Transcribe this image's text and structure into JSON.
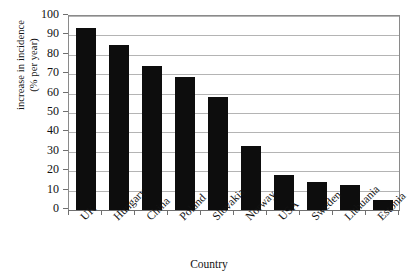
{
  "chart_data": {
    "type": "bar",
    "title": "",
    "subtitle": "",
    "xlabel": "Country",
    "ylabel": "increase in incidence (% per year)",
    "ylabel_line1": "increase in incidence",
    "ylabel_line2": "(% per year)",
    "categories": [
      "UK",
      "Hungary",
      "China",
      "Poland",
      "Slovakia",
      "Norway",
      "USA",
      "Sweden",
      "Lithuania",
      "Estonia"
    ],
    "values": [
      94,
      85,
      74,
      68.5,
      58,
      33,
      18,
      14.5,
      13,
      5
    ],
    "ylim": [
      0,
      100
    ],
    "ytick_labels": [
      "100",
      "90",
      "80",
      "70",
      "60",
      "50",
      "40",
      "30",
      "20",
      "10",
      "0"
    ],
    "ytick_values": [
      100,
      90,
      80,
      70,
      60,
      50,
      40,
      30,
      20,
      10,
      0
    ],
    "ytick_step": 10,
    "grid": true,
    "grid_axis": "y",
    "legend": false,
    "legend_position": "none",
    "bar_color": "#0d0d0d",
    "grid_color": "#b4b4b4",
    "axis_color": "#6f6f6f",
    "background_color": "#ffffff"
  }
}
